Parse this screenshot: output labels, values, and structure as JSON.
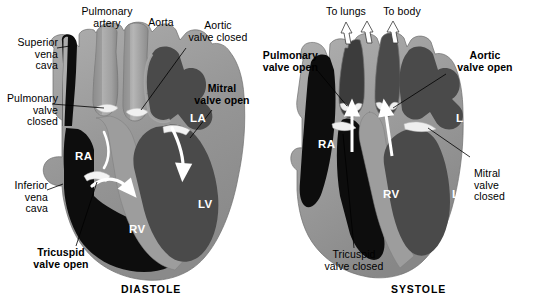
{
  "figure": {
    "panels": [
      {
        "id": "diastole",
        "caption": "DIASTOLE",
        "chambers": [
          {
            "name": "RA",
            "label": "RA"
          },
          {
            "name": "RV",
            "label": "RV"
          },
          {
            "name": "LA",
            "label": "LA"
          },
          {
            "name": "LV",
            "label": "LV"
          }
        ],
        "labels": [
          {
            "name": "superior-vena-cava",
            "text_lines": [
              "Superior",
              "vena",
              "cava"
            ],
            "bold": false
          },
          {
            "name": "pulmonary-valve-closed",
            "text_lines": [
              "Pulmonary",
              "valve",
              "closed"
            ],
            "bold": false
          },
          {
            "name": "inferior-vena-cava",
            "text_lines": [
              "Inferior",
              "vena",
              "cava"
            ],
            "bold": false
          },
          {
            "name": "pulmonary-artery",
            "text_lines": [
              "Pulmonary",
              "artery"
            ],
            "bold": false
          },
          {
            "name": "aorta",
            "text_lines": [
              "Aorta"
            ],
            "bold": false
          },
          {
            "name": "aortic-valve-closed",
            "text_lines": [
              "Aortic",
              "valve closed"
            ],
            "bold": false
          },
          {
            "name": "mitral-valve-open",
            "text_lines": [
              "Mitral",
              "valve open"
            ],
            "bold": true
          },
          {
            "name": "tricuspid-valve-open",
            "text_lines": [
              "Tricuspid",
              "valve open"
            ],
            "bold": true
          }
        ]
      },
      {
        "id": "systole",
        "caption": "SYSTOLE",
        "chambers": [
          {
            "name": "RA",
            "label": "RA"
          },
          {
            "name": "RV",
            "label": "RV"
          },
          {
            "name": "LA",
            "label": "LA"
          },
          {
            "name": "LV",
            "label": "LV"
          }
        ],
        "labels": [
          {
            "name": "to-lungs",
            "text_lines": [
              "To lungs"
            ],
            "bold": false
          },
          {
            "name": "to-body",
            "text_lines": [
              "To body"
            ],
            "bold": false
          },
          {
            "name": "pulmonary-valve-open",
            "text_lines": [
              "Pulmonary",
              "valve open"
            ],
            "bold": true
          },
          {
            "name": "aortic-valve-open",
            "text_lines": [
              "Aortic",
              "valve open"
            ],
            "bold": true
          },
          {
            "name": "mitral-valve-closed",
            "text_lines": [
              "Mitral",
              "valve",
              "closed"
            ],
            "bold": false
          },
          {
            "name": "tricuspid-valve-closed",
            "text_lines": [
              "Tricuspid",
              "valve closed"
            ],
            "bold": false
          }
        ]
      }
    ]
  },
  "diastole": {
    "caption": "DIASTOLE",
    "superior_vena_cava_1": "Superior",
    "superior_vena_cava_2": "vena",
    "superior_vena_cava_3": "cava",
    "pulmonary_valve_closed_1": "Pulmonary",
    "pulmonary_valve_closed_2": "valve",
    "pulmonary_valve_closed_3": "closed",
    "inferior_vena_cava_1": "Inferior",
    "inferior_vena_cava_2": "vena",
    "inferior_vena_cava_3": "cava",
    "pulmonary_artery_1": "Pulmonary",
    "pulmonary_artery_2": "artery",
    "aorta": "Aorta",
    "aortic_valve_closed_1": "Aortic",
    "aortic_valve_closed_2": "valve closed",
    "mitral_valve_open_1": "Mitral",
    "mitral_valve_open_2": "valve open",
    "tricuspid_valve_open_1": "Tricuspid",
    "tricuspid_valve_open_2": "valve open",
    "ra": "RA",
    "rv": "RV",
    "la": "LA",
    "lv": "LV"
  },
  "systole": {
    "caption": "SYSTOLE",
    "to_lungs": "To lungs",
    "to_body": "To body",
    "pulmonary_valve_open_1": "Pulmonary",
    "pulmonary_valve_open_2": "valve open",
    "aortic_valve_open_1": "Aortic",
    "aortic_valve_open_2": "valve open",
    "mitral_valve_closed_1": "Mitral",
    "mitral_valve_closed_2": "valve",
    "mitral_valve_closed_3": "closed",
    "tricuspid_valve_closed_1": "Tricuspid",
    "tricuspid_valve_closed_2": "valve closed",
    "ra": "RA",
    "rv": "RV",
    "la": "LA",
    "lv": "LV"
  },
  "colors": {
    "background": "#ffffff",
    "deoxygenated_blood": "#0d0d0d",
    "oxygenated_blood": "#4a4a4a",
    "myocardium": "#9a9a9a",
    "myocardium_light": "#b4b4b4",
    "great_vessel": "#a8a8a8",
    "great_vessel_shade": "#8e8e8e",
    "valve_leaflet": "#f2f2f2",
    "arrow_white": "#ffffff",
    "label_text": "#000000",
    "chamber_text": "#ffffff",
    "leader_line": "#000000"
  }
}
